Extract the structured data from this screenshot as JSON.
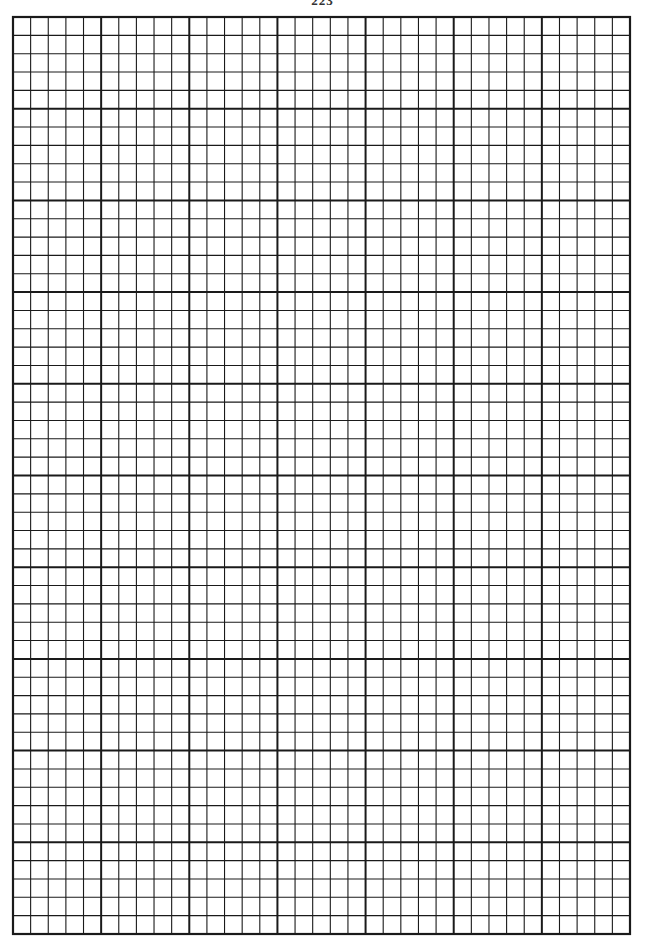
{
  "page": {
    "number_fragment": "223"
  },
  "grid": {
    "left": 13,
    "top": 17,
    "right": 630,
    "bottom": 934,
    "major_columns": 7,
    "major_rows": 10,
    "minor_per_major": 5,
    "line_color": "#1a1a1a",
    "minor_width": 1.1,
    "major_width": 2.0,
    "border_width": 2.2
  }
}
